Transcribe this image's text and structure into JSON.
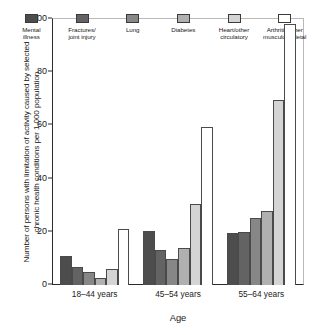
{
  "chart_data": {
    "type": "bar",
    "title": "",
    "xlabel": "Age",
    "ylabel": "Number of persons with limitation of activity caused by selected\nchronic health conditions per 1,000 population",
    "categories": [
      "18–44 years",
      "45–54 years",
      "55–64 years"
    ],
    "ylim": [
      0,
      100
    ],
    "yticks": [
      "0",
      "20",
      "40",
      "60",
      "80",
      "100"
    ],
    "ytick_values": [
      0,
      20,
      40,
      60,
      80,
      100
    ],
    "grid": false,
    "legend_position": "top-inside",
    "series": [
      {
        "name": "Mental\nillness",
        "color": "#4d4d4d",
        "values": [
          11,
          20.2,
          19.4
        ]
      },
      {
        "name": "Fractures/\njoint injury",
        "color": "#636363",
        "values": [
          6.7,
          13.3,
          20.1
        ]
      },
      {
        "name": "Lung",
        "color": "#878787",
        "values": [
          5,
          9.8,
          25.2
        ]
      },
      {
        "name": "Diabetes",
        "color": "#b0b0b0",
        "values": [
          2.8,
          13.9,
          27.9
        ]
      },
      {
        "name": "Heart/other\ncirculatory",
        "color": "#d4d4d4",
        "values": [
          6,
          30.3,
          69.5
        ]
      },
      {
        "name": "Arthritis/other\nmusculoskeletal",
        "color": "#ffffff",
        "values": [
          21.1,
          59.3,
          98
        ]
      }
    ]
  }
}
